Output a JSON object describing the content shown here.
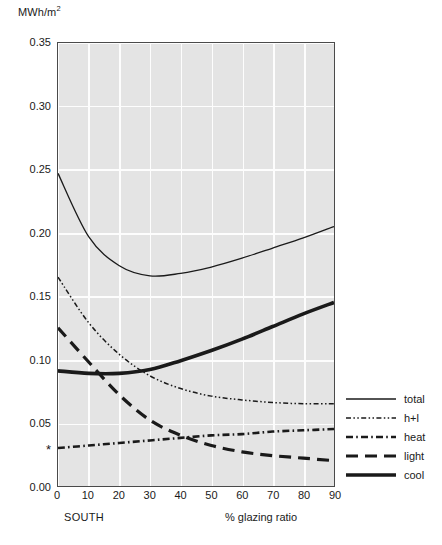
{
  "chart_data": {
    "type": "line",
    "title": "",
    "ylabel": "MWh/m",
    "ylabel_sup": "2",
    "xlabel": "% glazing ratio",
    "orientation_label": "SOUTH",
    "xlim": [
      0,
      90
    ],
    "ylim": [
      0.0,
      0.35
    ],
    "grid": true,
    "legend_position": "right",
    "x_ticks": [
      "0",
      "10",
      "20",
      "30",
      "40",
      "50",
      "60",
      "70",
      "80",
      "90"
    ],
    "x_tick_values": [
      0,
      10,
      20,
      30,
      40,
      50,
      60,
      70,
      80,
      90
    ],
    "y_ticks": [
      "0.00",
      "0.05",
      "0.10",
      "0.15",
      "0.20",
      "0.25",
      "0.30",
      "0.35"
    ],
    "y_tick_values": [
      0.0,
      0.05,
      0.1,
      0.15,
      0.2,
      0.25,
      0.3,
      0.35
    ],
    "y_marker_star": {
      "label": "*",
      "value": 0.0295
    },
    "x": [
      0,
      10,
      20,
      30,
      40,
      50,
      60,
      70,
      80,
      90
    ],
    "series": [
      {
        "name": "total",
        "style": "solid-thin",
        "values": [
          0.247,
          0.197,
          0.174,
          0.166,
          0.168,
          0.173,
          0.18,
          0.188,
          0.196,
          0.205
        ]
      },
      {
        "name": "h+l",
        "style": "dash-dot-dot-fine",
        "values": [
          0.165,
          0.129,
          0.104,
          0.087,
          0.077,
          0.071,
          0.068,
          0.066,
          0.065,
          0.065
        ]
      },
      {
        "name": "heat",
        "style": "dash-dot",
        "values": [
          0.03,
          0.032,
          0.034,
          0.036,
          0.038,
          0.04,
          0.041,
          0.043,
          0.044,
          0.045
        ]
      },
      {
        "name": "light",
        "style": "long-dash",
        "values": [
          0.125,
          0.098,
          0.072,
          0.052,
          0.04,
          0.032,
          0.027,
          0.024,
          0.022,
          0.02
        ]
      },
      {
        "name": "cool",
        "style": "solid-thick",
        "values": [
          0.091,
          0.089,
          0.089,
          0.092,
          0.099,
          0.107,
          0.116,
          0.126,
          0.136,
          0.145
        ]
      }
    ]
  },
  "legend": {
    "items": [
      {
        "label": "total"
      },
      {
        "label": "h+l"
      },
      {
        "label": "heat"
      },
      {
        "label": "light"
      },
      {
        "label": "cool"
      }
    ]
  },
  "colors": {
    "plot_background": "#e4e4e4",
    "gridline": "#fdfdfd",
    "axis_frame": "#4a4a4a",
    "series_line": "#1a1a1a",
    "text": "#1a1a1a"
  }
}
